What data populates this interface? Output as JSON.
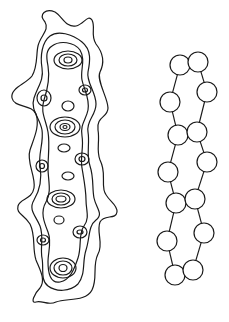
{
  "figure": {
    "left_panel": {
      "name": "contour-map",
      "description": "Elongated contour line drawing with nested loops",
      "stroke_color": "#1a1a1a"
    },
    "right_panel": {
      "name": "bead-chain",
      "description": "Circles linked in a twisted double chain",
      "stroke_color": "#1a1a1a",
      "beads": [
        {
          "cx": 180,
          "cy": 65,
          "r": 10
        },
        {
          "cx": 198,
          "cy": 62,
          "r": 10
        },
        {
          "cx": 207,
          "cy": 92,
          "r": 10
        },
        {
          "cx": 170,
          "cy": 102,
          "r": 10
        },
        {
          "cx": 178,
          "cy": 135,
          "r": 10
        },
        {
          "cx": 197,
          "cy": 132,
          "r": 10
        },
        {
          "cx": 207,
          "cy": 162,
          "r": 10
        },
        {
          "cx": 168,
          "cy": 172,
          "r": 10
        },
        {
          "cx": 176,
          "cy": 203,
          "r": 10
        },
        {
          "cx": 195,
          "cy": 199,
          "r": 10
        },
        {
          "cx": 204,
          "cy": 233,
          "r": 10
        },
        {
          "cx": 167,
          "cy": 241,
          "r": 10
        },
        {
          "cx": 175,
          "cy": 275,
          "r": 10
        },
        {
          "cx": 193,
          "cy": 270,
          "r": 10
        }
      ],
      "links": [
        [
          0,
          3
        ],
        [
          1,
          2
        ],
        [
          2,
          5
        ],
        [
          3,
          4
        ],
        [
          4,
          7
        ],
        [
          5,
          6
        ],
        [
          7,
          8
        ],
        [
          6,
          9
        ],
        [
          8,
          11
        ],
        [
          9,
          10
        ],
        [
          11,
          12
        ],
        [
          10,
          13
        ]
      ]
    }
  }
}
